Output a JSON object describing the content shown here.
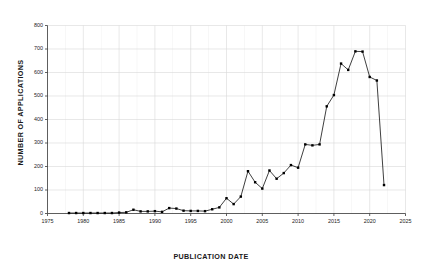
{
  "chart_data": {
    "type": "line",
    "title": "",
    "xlabel": "PUBLICATION DATE",
    "ylabel": "NUMBER OF APPLICATIONS",
    "xlim": [
      1975,
      2025
    ],
    "ylim": [
      0,
      800
    ],
    "xticks": [
      1975,
      1980,
      1985,
      1990,
      1995,
      2000,
      2005,
      2010,
      2015,
      2020,
      2025
    ],
    "yticks": [
      0,
      100,
      200,
      300,
      400,
      500,
      600,
      700,
      800
    ],
    "grid": true,
    "minor_grid_x": true,
    "legend": "none",
    "marker": "filled-square",
    "line_color": "#000000",
    "marker_color": "#000000",
    "grid_color": "#d9d9d9",
    "background": "#ffffff",
    "x": [
      1978,
      1979,
      1980,
      1981,
      1982,
      1983,
      1984,
      1985,
      1986,
      1987,
      1988,
      1989,
      1990,
      1991,
      1992,
      1993,
      1994,
      1995,
      1996,
      1997,
      1998,
      1999,
      2000,
      2001,
      2002,
      2003,
      2004,
      2005,
      2006,
      2007,
      2008,
      2009,
      2010,
      2011,
      2012,
      2013,
      2014,
      2015,
      2016,
      2017,
      2018,
      2019,
      2020,
      2021,
      2022
    ],
    "values": [
      2,
      2,
      2,
      2,
      2,
      2,
      2,
      4,
      5,
      16,
      9,
      9,
      10,
      7,
      23,
      21,
      12,
      11,
      11,
      10,
      18,
      26,
      65,
      40,
      72,
      180,
      133,
      106,
      183,
      148,
      172,
      206,
      195,
      294,
      290,
      294,
      456,
      504,
      638,
      611,
      690,
      689,
      581,
      566,
      121
    ],
    "series": [
      {
        "name": "Number of applications",
        "values": [
          2,
          2,
          2,
          2,
          2,
          2,
          2,
          4,
          5,
          16,
          9,
          9,
          10,
          7,
          23,
          21,
          12,
          11,
          11,
          10,
          18,
          26,
          65,
          40,
          72,
          180,
          133,
          106,
          183,
          148,
          172,
          206,
          195,
          294,
          290,
          294,
          456,
          504,
          638,
          611,
          690,
          689,
          581,
          566,
          121
        ]
      }
    ]
  }
}
